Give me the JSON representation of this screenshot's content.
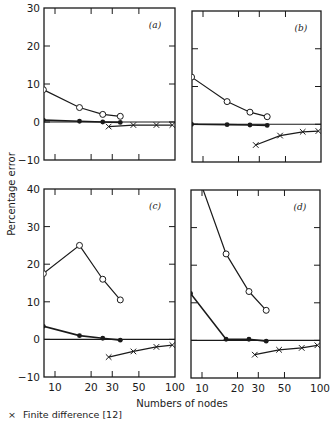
{
  "chart_data": [
    {
      "type": "line",
      "panel": "(a)",
      "title": "",
      "xlabel": "Numbers of nodes",
      "ylabel": "Percentage error",
      "xscale": "log",
      "xlim": [
        7,
        100
      ],
      "ylim": [
        -10,
        30
      ],
      "yticks": [
        -10,
        0,
        10,
        20,
        30
      ],
      "xticks": [
        10,
        20,
        30,
        50,
        100
      ],
      "grid": false,
      "series": [
        {
          "name": "open-circle",
          "marker": "open-circle",
          "x": [
            8,
            16,
            25,
            35
          ],
          "y": [
            8.5,
            3.8,
            2.0,
            1.5
          ]
        },
        {
          "name": "filled-circle",
          "marker": "filled-circle",
          "x": [
            8,
            16,
            25,
            35
          ],
          "y": [
            0.5,
            0.2,
            0.0,
            -0.1
          ]
        },
        {
          "name": "Finite difference [12]",
          "marker": "x",
          "x": [
            28,
            45,
            70,
            95
          ],
          "y": [
            -1.2,
            -0.8,
            -0.8,
            -0.8
          ]
        }
      ]
    },
    {
      "type": "line",
      "panel": "(b)",
      "xscale": "log",
      "xlim": [
        7,
        100
      ],
      "ylim": [
        -10,
        30
      ],
      "yticks": [
        -10,
        0,
        10,
        20,
        30
      ],
      "xticks": [
        10,
        20,
        30,
        50,
        100
      ],
      "grid": false,
      "series": [
        {
          "name": "open-circle",
          "marker": "open-circle",
          "x": [
            8,
            16,
            25,
            35
          ],
          "y": [
            12.5,
            6.0,
            3.2,
            2.0
          ]
        },
        {
          "name": "filled-circle",
          "marker": "filled-circle",
          "x": [
            8,
            16,
            25,
            35
          ],
          "y": [
            0.0,
            -0.1,
            -0.2,
            -0.3
          ]
        },
        {
          "name": "Finite difference [12]",
          "marker": "x",
          "x": [
            28,
            45,
            70,
            95
          ],
          "y": [
            -5.5,
            -3.0,
            -2.0,
            -1.8
          ]
        }
      ]
    },
    {
      "type": "line",
      "panel": "(c)",
      "xscale": "log",
      "xlim": [
        7,
        100
      ],
      "ylim": [
        -10,
        40
      ],
      "yticks": [
        -10,
        0,
        10,
        20,
        30,
        40
      ],
      "xticks": [
        10,
        20,
        30,
        50,
        100
      ],
      "grid": false,
      "series": [
        {
          "name": "open-circle",
          "marker": "open-circle",
          "x": [
            8,
            16,
            25,
            35
          ],
          "y": [
            17.5,
            25.0,
            16.0,
            10.5
          ]
        },
        {
          "name": "filled-circle",
          "marker": "filled-circle",
          "x": [
            8,
            16,
            25,
            35
          ],
          "y": [
            3.5,
            1.0,
            0.3,
            -0.2
          ]
        },
        {
          "name": "Finite difference [12]",
          "marker": "x",
          "x": [
            28,
            45,
            70,
            95
          ],
          "y": [
            -4.7,
            -3.2,
            -2.0,
            -1.5
          ]
        }
      ]
    },
    {
      "type": "line",
      "panel": "(d)",
      "xscale": "log",
      "xlim": [
        7,
        100
      ],
      "ylim": [
        -10,
        40
      ],
      "yticks": [
        -10,
        0,
        10,
        20,
        30,
        40
      ],
      "xticks": [
        10,
        20,
        30,
        50,
        100
      ],
      "grid": false,
      "series": [
        {
          "name": "open-circle",
          "marker": "open-circle",
          "x": [
            8.6,
            16,
            25,
            35
          ],
          "y": [
            40.0,
            23.0,
            13.0,
            8.0
          ],
          "note": "first segment enters from above the plot top"
        },
        {
          "name": "filled-circle",
          "marker": "filled-circle",
          "x": [
            8,
            16,
            25,
            35
          ],
          "y": [
            12.5,
            0.3,
            0.3,
            -0.2
          ]
        },
        {
          "name": "Finite difference [12]",
          "marker": "x",
          "x": [
            28,
            45,
            70,
            95
          ],
          "y": [
            -3.8,
            -2.5,
            -2.0,
            -1.3
          ]
        }
      ]
    }
  ],
  "figure": {
    "ylabel": "Percentage error",
    "xlabel": "Numbers of nodes",
    "panel_labels": [
      "(a)",
      "(b)",
      "(c)",
      "(d)"
    ],
    "top_yticks": [
      "30",
      "20",
      "10",
      "0",
      "−10"
    ],
    "bottom_yticks": [
      "40",
      "30",
      "20",
      "10",
      "0",
      "−10"
    ],
    "xtick_labels": [
      "10",
      "20",
      "30",
      "50",
      "100"
    ]
  },
  "legend": {
    "marker": "×",
    "label": "Finite difference [12]"
  }
}
